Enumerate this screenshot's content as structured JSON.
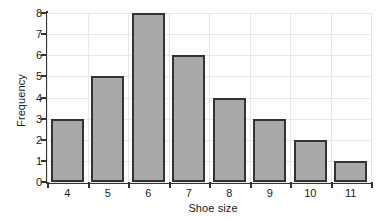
{
  "chart_data": {
    "type": "bar",
    "title": "",
    "subtitle": "",
    "xlabel": "Shoe size",
    "ylabel": "Frequency",
    "categories": [
      "4",
      "5",
      "6",
      "7",
      "8",
      "9",
      "10",
      "11"
    ],
    "values": [
      3,
      5,
      8,
      6,
      4,
      3,
      2,
      1
    ],
    "ylim": [
      0,
      8
    ],
    "y_ticks": [
      "0",
      "1",
      "2",
      "3",
      "4",
      "5",
      "6",
      "7",
      "8"
    ],
    "x_ticks": [
      "4",
      "5",
      "6",
      "7",
      "8",
      "9",
      "10",
      "11"
    ],
    "grid": "both",
    "legend": "none",
    "annotations": [],
    "colors": {
      "bar_fill": "#a9a9a9",
      "bar_edge": "#333333",
      "gridline": "#e8e8e8",
      "axis": "#333333",
      "text": "#1a1a1a",
      "background": "#ffffff"
    }
  }
}
